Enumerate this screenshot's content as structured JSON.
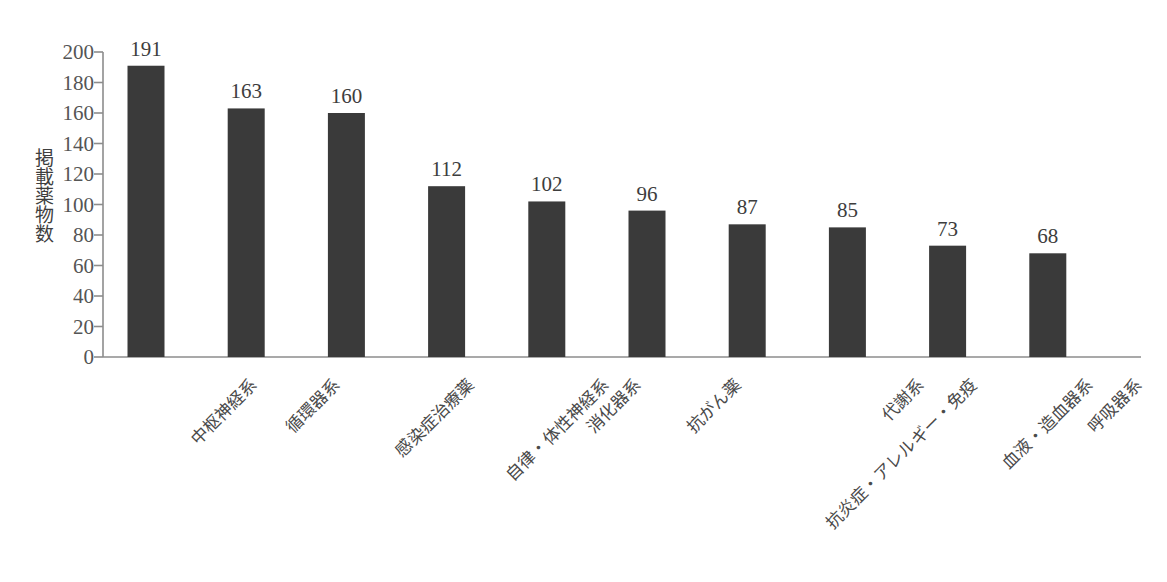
{
  "chart_data": {
    "type": "bar",
    "title": "",
    "subtitle": "",
    "xlabel": "",
    "ylabel": "掲載薬物数",
    "ylim": [
      0,
      200
    ],
    "ytick_step": 20,
    "yticks": [
      200,
      180,
      160,
      140,
      120,
      100,
      80,
      60,
      40,
      20,
      0
    ],
    "grid": false,
    "legend": null,
    "legend_position": "none",
    "bar_color": "#3a3a3a",
    "axis_color": "#8c8c8c",
    "categories": [
      "中枢神経系",
      "循環器系",
      "感染症治療薬",
      "自律・体性神経系",
      "消化器系",
      "抗がん薬",
      "抗炎症・アレルギー・免疫",
      "代謝系",
      "血液・造血器系",
      "呼吸器系"
    ],
    "values": [
      191,
      163,
      160,
      112,
      102,
      96,
      87,
      85,
      73,
      68
    ],
    "value_labels": [
      "191",
      "163",
      "160",
      "112",
      "102",
      "96",
      "87",
      "85",
      "73",
      "68"
    ],
    "annotations": []
  },
  "footer": {
    "note": ""
  }
}
